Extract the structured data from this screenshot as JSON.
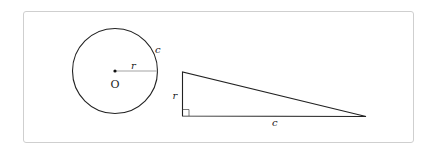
{
  "diagram": {
    "circle": {
      "center_label": "O",
      "radius_label": "r",
      "circumference_label": "c"
    },
    "triangle": {
      "height_label": "r",
      "base_label": "c",
      "right_angle": true
    },
    "colors": {
      "stroke": "#222222",
      "radius_line": "#999999",
      "frame_border": "#cfcfcf"
    }
  }
}
